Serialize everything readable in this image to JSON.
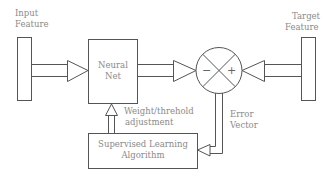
{
  "diagram": {
    "input": {
      "label_line1": "Input",
      "label_line2": "Feature"
    },
    "target": {
      "label_line1": "Target",
      "label_line2": "Feature"
    },
    "neural_net": {
      "label_line1": "Neural",
      "label_line2": "Net"
    },
    "comparator": {
      "minus": "−",
      "plus": "+"
    },
    "error": {
      "label_line1": "Error",
      "label_line2": "Vector"
    },
    "adjustment": {
      "label_line1": "Weight/threhold",
      "label_line2": "adjustment"
    },
    "algorithm": {
      "label_line1": "Supervised Learning",
      "label_line2": "Algorithm"
    },
    "colors": {
      "stroke": "#555555",
      "text": "#8a8a8a",
      "background": "#ffffff"
    }
  }
}
